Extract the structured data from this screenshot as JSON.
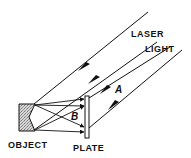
{
  "diagram": {
    "labels": {
      "laser": "LASER",
      "light": "LIGHT",
      "object": "OBJECT",
      "plate": "PLATE",
      "beam_a": "A",
      "beam_b": "B"
    },
    "colors": {
      "ink": "#111111",
      "object_fill": "#cfcfcf",
      "background": "#ffffff"
    }
  }
}
